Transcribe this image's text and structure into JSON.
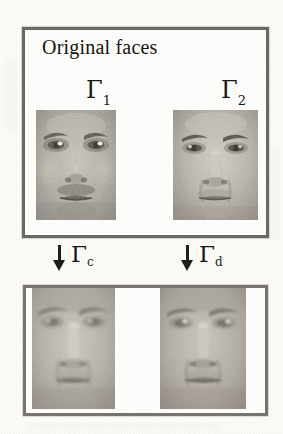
{
  "figure": {
    "caption_title": "Original faces",
    "background_color": "#fbfaf7",
    "frame_color": "#6b6964",
    "ink_color": "#1a1814"
  },
  "panels": {
    "top": {
      "name": "original-faces-panel",
      "title": "Original faces",
      "items": [
        {
          "symbol": "Γ",
          "subscript": "1",
          "label": "Γ₁",
          "image": "face-photo-subject-1"
        },
        {
          "symbol": "Γ",
          "subscript": "2",
          "label": "Γ₂",
          "image": "face-photo-subject-2"
        }
      ]
    },
    "bottom": {
      "name": "transformed-faces-panel",
      "title": "",
      "items": [
        {
          "symbol": "Γ",
          "subscript": "c",
          "label": "Γc",
          "image": "face-photo-transformed-c"
        },
        {
          "symbol": "Γ",
          "subscript": "d",
          "label": "Γd",
          "image": "face-photo-transformed-d"
        }
      ]
    }
  },
  "arrows": [
    {
      "name": "arrow-gamma-c",
      "glyph": "↓",
      "symbol": "Γ",
      "subscript": "c"
    },
    {
      "name": "arrow-gamma-d",
      "glyph": "↓",
      "symbol": "Γ",
      "subscript": "d"
    }
  ]
}
